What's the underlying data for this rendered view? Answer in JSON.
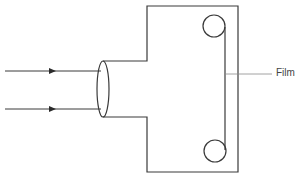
{
  "diagram": {
    "type": "camera schematic",
    "labels": {
      "film": "Film"
    },
    "components": [
      "incoming light rays",
      "lens",
      "camera body",
      "top film spool",
      "bottom film spool",
      "film strip"
    ],
    "colors": {
      "stroke": "#3a3a3a",
      "leader": "#8a8a8a",
      "text": "#444444",
      "background": "#ffffff"
    }
  }
}
